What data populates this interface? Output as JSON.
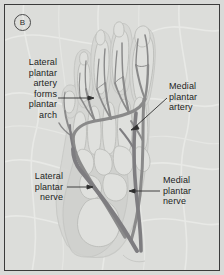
{
  "figure": {
    "panel_letter": "B",
    "view": "plantar-foot-neurovascular-diagram"
  },
  "labels": {
    "lateral_plantar_artery": "Lateral\nplantar\nartery\nforms\nplantar\narch",
    "medial_plantar_artery": "Medial\nplantar\nartery",
    "lateral_plantar_nerve": "Lateral\nplantar\nnerve",
    "medial_plantar_nerve": "Medial\nplantar\nnerve"
  },
  "colors": {
    "plate_background": "#dcddda",
    "plate_border": "#3b3b3b",
    "vessel": "#8a8a8a",
    "vessel_dark": "#7b7a7c",
    "bone_outline": "#bfc0bd",
    "soft_tissue": "#cfd0cd",
    "leader_line": "#2f2f2f",
    "text": "#1d1d1d"
  }
}
